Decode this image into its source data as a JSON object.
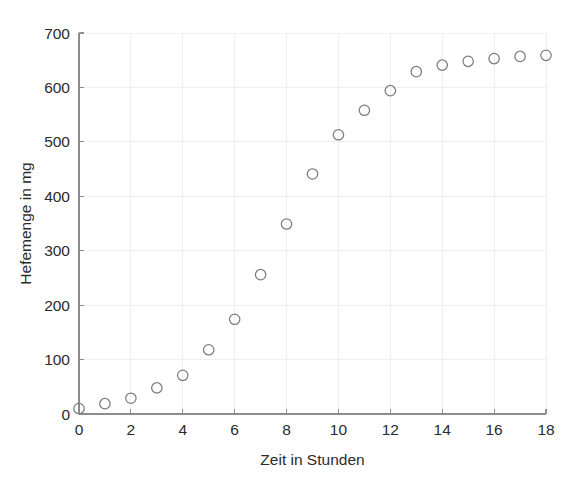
{
  "chart_data": {
    "type": "scatter",
    "title": "",
    "subtitle": "",
    "xlabel": "Zeit in Stunden",
    "ylabel": "Hefemenge in mg",
    "xlim": [
      0,
      18
    ],
    "ylim": [
      0,
      700
    ],
    "xticks": [
      0,
      2,
      4,
      6,
      8,
      10,
      12,
      14,
      16,
      18
    ],
    "yticks": [
      0,
      100,
      200,
      300,
      400,
      500,
      600,
      700
    ],
    "xtick_labels": [
      "0",
      "2",
      "4",
      "6",
      "8",
      "10",
      "12",
      "14",
      "16",
      "18"
    ],
    "ytick_labels": [
      "0",
      "100",
      "200",
      "300",
      "400",
      "500",
      "600",
      "700"
    ],
    "grid": true,
    "legend": null,
    "legend_position": "none",
    "marker_style": "open-circle",
    "marker_color": "#7a7a82",
    "axis_color": "#8d8d8d",
    "grid_color": "#ededf1",
    "background_color": "#ffffff",
    "series": [
      {
        "name": "Hefemenge",
        "x": [
          0,
          1,
          2,
          3,
          4,
          5,
          6,
          7,
          8,
          9,
          10,
          11,
          12,
          13,
          14,
          15,
          16,
          17,
          18
        ],
        "y": [
          10,
          19,
          29,
          48,
          71,
          118,
          174,
          256,
          349,
          441,
          513,
          558,
          594,
          629,
          641,
          648,
          653,
          657,
          659
        ]
      }
    ]
  }
}
